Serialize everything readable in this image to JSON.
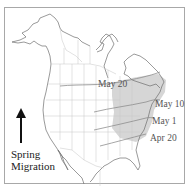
{
  "map": {
    "region": "North America",
    "legend": {
      "title_line1": "Spring",
      "title_line2": "Migration",
      "arrow_direction": "north",
      "arrow_icon": "arrow-up-icon"
    },
    "isolines": [
      {
        "label": "May 20"
      },
      {
        "label": "May 10"
      },
      {
        "label": "May 1"
      },
      {
        "label": "Apr 20"
      }
    ],
    "colors": {
      "range_fill": "#d6d6d6",
      "coastline": "#6e6e6e",
      "borders": "#c4c4c4",
      "isoline": "#8a8a8a",
      "frame": "#a8a8a8"
    }
  }
}
